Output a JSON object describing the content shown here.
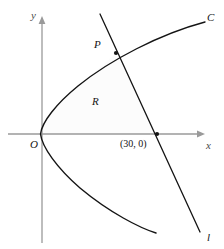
{
  "figure": {
    "background_color": "#ffffff",
    "width": 224,
    "height": 249
  },
  "axes": {
    "color": "#9a9a9a",
    "origin": {
      "x": 42,
      "y": 134
    },
    "x_axis": {
      "label": "x",
      "label_pos": {
        "x": 206,
        "y": 140
      },
      "from": {
        "x": 8,
        "y": 134
      },
      "to": {
        "x": 205,
        "y": 134
      },
      "arrow": "right"
    },
    "y_axis": {
      "label": "y",
      "label_pos": {
        "x": 31,
        "y": 10
      },
      "from": {
        "x": 42,
        "y": 243
      },
      "to": {
        "x": 42,
        "y": 17
      },
      "arrow": "up"
    }
  },
  "curve": {
    "name": "C",
    "label": "C",
    "label_pos": {
      "x": 207,
      "y": 12
    },
    "color": "#141414",
    "stroke_width": 1.4,
    "description": "rightward-opening parabola with vertex near origin",
    "path": "M 205 22 C 160 34 110 60 78 86 C 56 104 42 122 40.5 134 C 42 147 57 168 80 188 C 110 213 140 228 156 233"
  },
  "line": {
    "name": "l",
    "label": "l",
    "label_pos": {
      "x": 207,
      "y": 232
    },
    "color": "#141414",
    "stroke_width": 1.3,
    "from": {
      "x": 100,
      "y": 14
    },
    "to": {
      "x": 200,
      "y": 232
    }
  },
  "region": {
    "label": "R",
    "label_pos": {
      "x": 92,
      "y": 96
    },
    "fill_color": "#fcfcfc",
    "description": "region bounded by curve C, line l and the axes"
  },
  "points": [
    {
      "name": "P",
      "label": "P",
      "label_pos": {
        "x": 94,
        "y": 39
      },
      "marker": {
        "x": 116,
        "y": 53
      },
      "marker_radius": 2.1,
      "color": "#141414"
    },
    {
      "name": "x-intercept",
      "label": "(30, 0)",
      "label_pos": {
        "x": 120,
        "y": 139
      },
      "marker": {
        "x": 157,
        "y": 134
      },
      "marker_radius": 2.1,
      "color": "#141414"
    },
    {
      "name": "origin",
      "label": "O",
      "label_pos": {
        "x": 30,
        "y": 139
      },
      "marker": null,
      "color": "#141414"
    }
  ]
}
